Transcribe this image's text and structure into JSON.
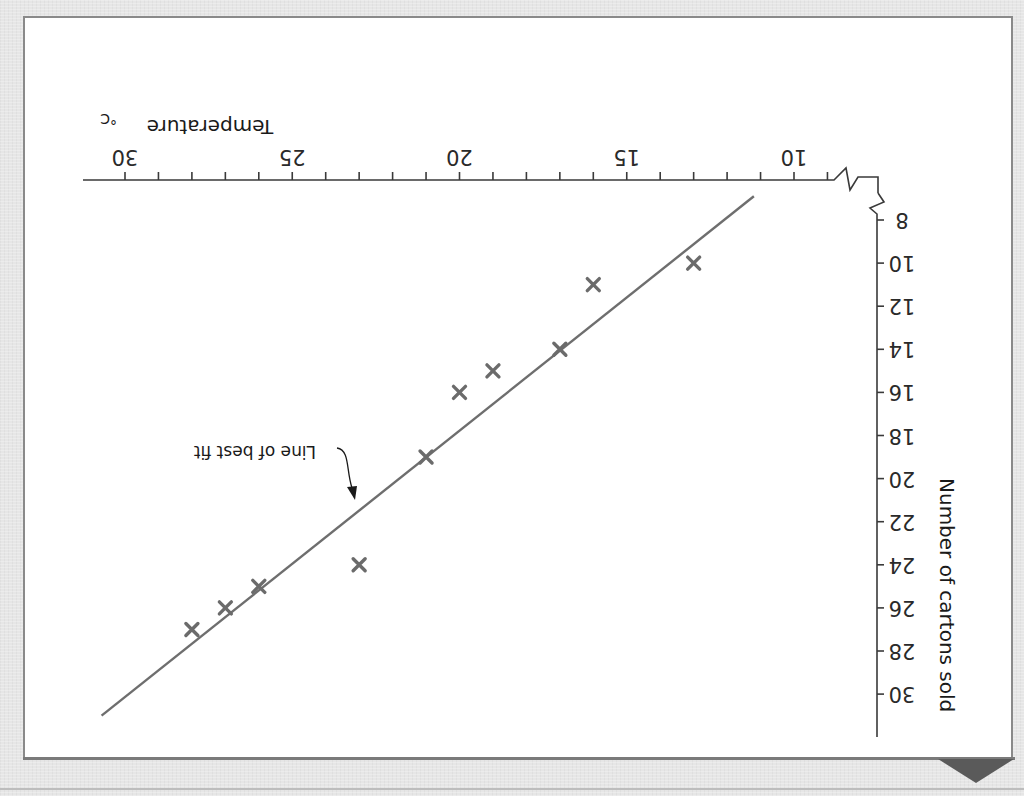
{
  "orientation": "rotated 180 degrees (x-axis label horizontal upside-down, y-axis title vertical)",
  "chart": {
    "x_axis_title": "Temperature",
    "x_axis_unit": "°C",
    "y_axis_title": "Number of cartons sold",
    "annotation": "Line of best fit",
    "x_tick_labels": [
      "10",
      "15",
      "20",
      "25",
      "30"
    ],
    "y_tick_labels": [
      "8",
      "10",
      "12",
      "14",
      "16",
      "18",
      "20",
      "22",
      "24",
      "26",
      "28",
      "30"
    ]
  },
  "colors": {
    "background": "#e6e6e6",
    "panel": "#ffffff",
    "axis": "#3a3a3a",
    "marker": "#6b6b6b",
    "fit_line": "#6e6e6e",
    "corner_arrow": "#5a5a5a"
  },
  "chart_data": {
    "type": "scatter",
    "title": "",
    "xlabel": "Temperature °C",
    "ylabel": "Number of cartons sold",
    "xlim": [
      10,
      30
    ],
    "ylim": [
      8,
      30
    ],
    "x_ticks_major": [
      10,
      15,
      20,
      25,
      30
    ],
    "x_ticks_minor_step": 1,
    "y_ticks": [
      8,
      10,
      12,
      14,
      16,
      18,
      20,
      22,
      24,
      26,
      28,
      30
    ],
    "axis_break": "both axes start with a zigzag break symbol at the origin",
    "grid": false,
    "legend": null,
    "series": [
      {
        "name": "Observations",
        "marker": "x",
        "points": [
          {
            "x": 13,
            "y": 10
          },
          {
            "x": 16,
            "y": 11
          },
          {
            "x": 17,
            "y": 14
          },
          {
            "x": 19,
            "y": 15
          },
          {
            "x": 20,
            "y": 16
          },
          {
            "x": 21,
            "y": 19
          },
          {
            "x": 23,
            "y": 24
          },
          {
            "x": 26,
            "y": 25
          },
          {
            "x": 27,
            "y": 26
          },
          {
            "x": 28,
            "y": 27
          }
        ]
      },
      {
        "name": "Line of best fit",
        "type": "line",
        "points": [
          {
            "x": 11.2,
            "y": 6.9
          },
          {
            "x": 30.7,
            "y": 31.0
          }
        ]
      }
    ],
    "annotations": [
      {
        "text": "Line of best fit",
        "arrow_to": {
          "x": 23.1,
          "y": 21.8
        }
      }
    ],
    "rendered_rotation_deg": 180
  }
}
